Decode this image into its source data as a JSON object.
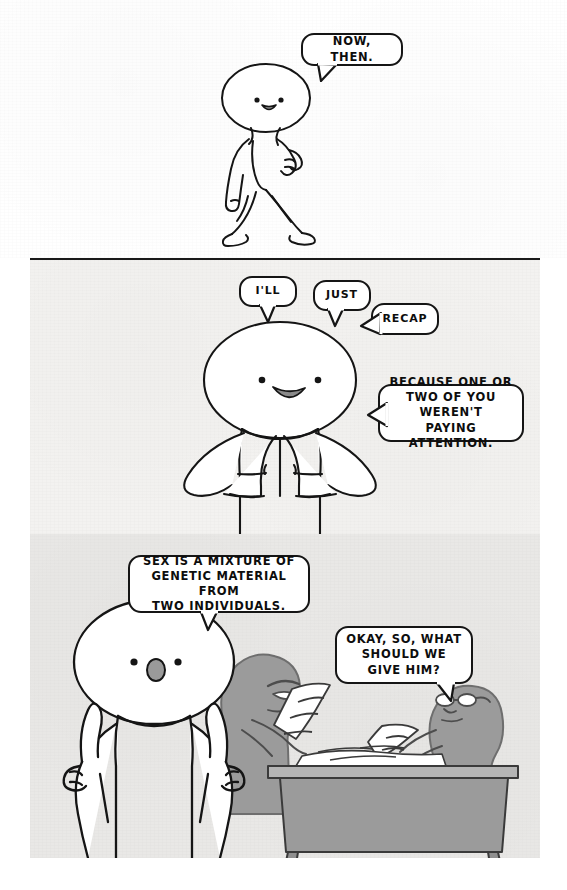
{
  "comic": {
    "title": "Three-panel comic strip",
    "page_size": {
      "width": 567,
      "height": 890
    },
    "ink_color": "#151515",
    "paper_color": "#ffffff",
    "panel2_bg": "#f3f2f0",
    "panel3_bg": "#e9e8e6",
    "silhouette_color": "#9b9b9b"
  },
  "panels": [
    {
      "id": "panel-1",
      "index": 1,
      "background": "#ffffff",
      "character": "walking-figure",
      "description": "Round-headed figure walking to the right, smiling, one hand raised.",
      "bubbles": [
        {
          "id": "bubble-now-then",
          "text": "NOW, THEN.",
          "tail": "bottom-left"
        }
      ]
    },
    {
      "id": "panel-2",
      "index": 2,
      "background": "#f3f2f0",
      "character": "steepled-hands-figure",
      "description": "Figure facing viewer with fingertips pressed together, smiling.",
      "bubbles": [
        {
          "id": "bubble-ill",
          "text": "I'LL",
          "tail": "bottom"
        },
        {
          "id": "bubble-just",
          "text": "JUST",
          "tail": "bottom"
        },
        {
          "id": "bubble-recap",
          "text": "RECAP",
          "tail": "left"
        },
        {
          "id": "bubble-because",
          "text": "BECAUSE ONE OR\nTWO OF YOU WEREN'T\nPAYING ATTENTION.",
          "tail": "left"
        }
      ]
    },
    {
      "id": "panel-3",
      "index": 3,
      "background": "#e9e8e6",
      "characters": [
        "big-foreground-figure-two-fingers-raised",
        "gray-scowling-figure-at-desk",
        "gray-figure-with-glasses-at-desk"
      ],
      "props": [
        "desk",
        "scattered-papers"
      ],
      "bubbles": [
        {
          "id": "bubble-sex-is-a-mixture",
          "text": "SEX IS A MIXTURE OF\nGENETIC MATERIAL FROM\nTWO INDIVIDUALS.",
          "tail": "bottom"
        },
        {
          "id": "bubble-okay-so-what",
          "text": "OKAY, SO, WHAT\nSHOULD WE\nGIVE HIM?",
          "tail": "bottom-right"
        }
      ]
    }
  ]
}
